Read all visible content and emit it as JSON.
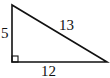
{
  "diagram": {
    "type": "right-triangle",
    "stroke_color": "#111111",
    "background": "#ffffff",
    "sides": {
      "vertical_leg": "5",
      "horizontal_leg": "12",
      "hypotenuse": "13"
    },
    "right_angle_marker": true
  }
}
